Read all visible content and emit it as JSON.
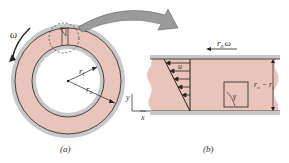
{
  "figure": {
    "panel_a": {
      "caption": "(a)",
      "omega_label": "ω",
      "r_inner_label": "r",
      "r_inner_sub": "i",
      "r_outer_label": "r",
      "r_outer_sub": "o",
      "axis_y": "y"
    },
    "panel_b": {
      "caption": "(b)",
      "velocity_label": "r",
      "velocity_sub": "o",
      "velocity_omega": "ω",
      "u_label": "u",
      "gap_label": "r",
      "gap_sub_o": "o",
      "gap_minus": " − r",
      "gap_sub_i": "i",
      "gamma_label": "γ",
      "axis_x": "x"
    },
    "colors": {
      "fluid": "#e8c4bb",
      "wall": "#c8c8c8",
      "line": "#222222",
      "arrow_fill": "#9a9a9a"
    }
  }
}
